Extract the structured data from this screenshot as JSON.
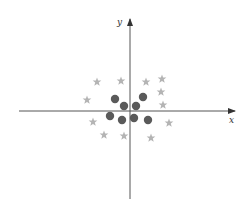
{
  "diagram": {
    "type": "scatter-classification",
    "axes": {
      "x_label": "x",
      "y_label": "y",
      "origin_px": [
        130,
        111
      ],
      "x_range_px": [
        19,
        235
      ],
      "y_range_px": [
        20,
        199
      ],
      "color": "#555555"
    },
    "classes": [
      {
        "name": "stars",
        "marker": "star",
        "color": "#b4b4b4",
        "points_px": [
          [
            97,
            82
          ],
          [
            121,
            81
          ],
          [
            146,
            82
          ],
          [
            162,
            79
          ],
          [
            87,
            100
          ],
          [
            161,
            92
          ],
          [
            163,
            105
          ],
          [
            93,
            122
          ],
          [
            169,
            123
          ],
          [
            104,
            135
          ],
          [
            124,
            136
          ],
          [
            151,
            138
          ]
        ]
      },
      {
        "name": "circles",
        "marker": "circle",
        "color": "#5a5a5a",
        "points_px": [
          [
            115,
            99
          ],
          [
            143,
            97
          ],
          [
            124,
            106
          ],
          [
            136,
            106
          ],
          [
            110,
            116
          ],
          [
            122,
            120
          ],
          [
            134,
            118
          ],
          [
            148,
            120
          ]
        ]
      }
    ]
  }
}
